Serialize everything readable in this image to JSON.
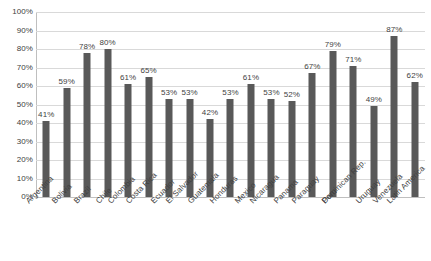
{
  "chart_data": {
    "type": "bar",
    "title": "",
    "subtitle": "",
    "xlabel": "",
    "ylabel": "",
    "ylim": [
      0,
      100
    ],
    "yticks": [
      "0%",
      "10%",
      "20%",
      "30%",
      "40%",
      "50%",
      "60%",
      "70%",
      "80%",
      "90%",
      "100%"
    ],
    "ytick_values": [
      0,
      10,
      20,
      30,
      40,
      50,
      60,
      70,
      80,
      90,
      100
    ],
    "grid": true,
    "legend": false,
    "legend_position": "none",
    "value_suffix": "%",
    "bar_color": "#595959",
    "gridline_color": "#d9d9d9",
    "axis_color": "#bfbfbf",
    "background_color": "#ffffff",
    "text_color": "#404040",
    "categories": [
      "Argentina",
      "Bolivia",
      "Brazil",
      "Chile",
      "Colombia",
      "Costa Rica",
      "Ecuador",
      "El Salvador",
      "Guatemala",
      "Honduras",
      "Mexico",
      "Nicaragua",
      "Panama",
      "Paraguay",
      "Peru",
      "Dominican Rep.",
      "Uruguay",
      "Venezuela",
      "Latin America"
    ],
    "values": [
      41,
      59,
      78,
      80,
      61,
      65,
      53,
      53,
      42,
      53,
      61,
      53,
      52,
      67,
      79,
      71,
      49,
      87,
      62
    ],
    "data_labels": [
      "41%",
      "59%",
      "78%",
      "80%",
      "61%",
      "65%",
      "53%",
      "53%",
      "42%",
      "53%",
      "61%",
      "53%",
      "52%",
      "67%",
      "79%",
      "71%",
      "49%",
      "87%",
      "62%"
    ]
  }
}
